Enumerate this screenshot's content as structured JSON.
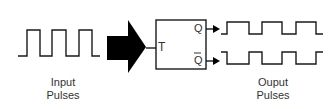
{
  "diagram": {
    "block_input_label": "T",
    "output_q_label": "Q",
    "output_qbar_label": "Q",
    "input_caption_line1": "Input",
    "input_caption_line2": "Pulses",
    "output_caption_line1": "Ouput",
    "output_caption_line2": "Pulses"
  },
  "colors": {
    "stroke": "#1a1a1a",
    "arrow_fill": "#000000",
    "text": "#333333"
  }
}
